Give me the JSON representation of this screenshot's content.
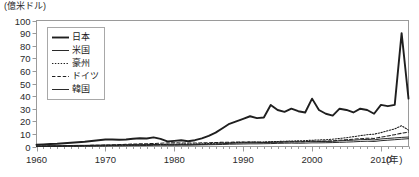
{
  "unit_label": "(億米ドル)",
  "source_note": "",
  "axes": {
    "y_ticks": [
      "0",
      "10",
      "20",
      "30",
      "40",
      "50",
      "60",
      "70",
      "80",
      "90",
      "100"
    ],
    "x_ticks": [
      "1960",
      "1970",
      "1980",
      "1990",
      "2000",
      "2010"
    ],
    "x_unit": "(年)"
  },
  "legend": {
    "items": [
      {
        "label": "日本",
        "style": "solid-thick",
        "color": "#1a1a1a"
      },
      {
        "label": "米国",
        "style": "solid",
        "color": "#3a3a3a"
      },
      {
        "label": "豪州",
        "style": "dotted",
        "color": "#3a3a3a"
      },
      {
        "label": "ドイツ",
        "style": "dashed",
        "color": "#3a3a3a"
      },
      {
        "label": "韓国",
        "style": "solid",
        "color": "#3a3a3a"
      }
    ]
  },
  "chart_data": {
    "type": "line",
    "title": "",
    "subtitle": "",
    "xlabel": "(年)",
    "ylabel": "(億米ドル)",
    "xlim": [
      1960,
      2014
    ],
    "ylim": [
      0,
      100
    ],
    "y_ticks": [
      0,
      10,
      20,
      30,
      40,
      50,
      60,
      70,
      80,
      90,
      100
    ],
    "x_ticks": [
      1960,
      1970,
      1980,
      1990,
      2000,
      2010
    ],
    "grid": false,
    "legend_position": "top-left-inside",
    "x": [
      1960,
      1961,
      1962,
      1963,
      1964,
      1965,
      1966,
      1967,
      1968,
      1969,
      1970,
      1971,
      1972,
      1973,
      1974,
      1975,
      1976,
      1977,
      1978,
      1979,
      1980,
      1981,
      1982,
      1983,
      1984,
      1985,
      1986,
      1987,
      1988,
      1989,
      1990,
      1991,
      1992,
      1993,
      1994,
      1995,
      1996,
      1997,
      1998,
      1999,
      2000,
      2001,
      2002,
      2003,
      2004,
      2005,
      2006,
      2007,
      2008,
      2009,
      2010,
      2011,
      2012,
      2013,
      2014
    ],
    "series": [
      {
        "name": "日本",
        "style": "solid-thick",
        "values": [
          1.5,
          1.7,
          2.0,
          2.2,
          2.6,
          3.0,
          3.4,
          3.8,
          4.4,
          5.0,
          5.5,
          5.6,
          5.4,
          5.6,
          6.2,
          6.6,
          6.4,
          7.2,
          6.0,
          4.0,
          4.5,
          5.0,
          4.2,
          5.0,
          6.5,
          8.5,
          11.0,
          14.5,
          18.0,
          20.0,
          22.0,
          24.0,
          22.5,
          23.0,
          33.0,
          29.0,
          27.5,
          30.0,
          28.0,
          27.0,
          38.0,
          29.0,
          26.0,
          24.5,
          30.0,
          29.0,
          27.0,
          30.0,
          29.0,
          26.0,
          33.0,
          32.0,
          33.0,
          90.0,
          38.0
        ]
      },
      {
        "name": "米国",
        "style": "solid",
        "values": [
          0.5,
          0.5,
          0.6,
          0.6,
          0.7,
          0.8,
          0.9,
          0.9,
          1.0,
          1.1,
          1.2,
          1.2,
          1.3,
          1.4,
          1.5,
          1.5,
          1.5,
          1.6,
          1.5,
          1.4,
          1.4,
          1.5,
          1.4,
          1.5,
          1.6,
          1.8,
          2.0,
          2.2,
          2.5,
          2.7,
          2.9,
          3.0,
          3.0,
          3.1,
          3.3,
          3.4,
          3.5,
          3.7,
          3.7,
          3.8,
          4.2,
          4.0,
          4.0,
          4.1,
          4.5,
          4.8,
          5.0,
          5.4,
          5.6,
          5.2,
          6.0,
          6.4,
          6.8,
          7.2,
          7.5
        ]
      },
      {
        "name": "豪州",
        "style": "dotted",
        "values": [
          0.2,
          0.2,
          0.3,
          0.3,
          0.3,
          0.4,
          0.4,
          0.5,
          0.5,
          0.6,
          0.7,
          0.8,
          0.9,
          1.0,
          1.1,
          1.2,
          1.3,
          1.5,
          1.6,
          1.7,
          1.8,
          1.9,
          1.9,
          2.0,
          2.2,
          2.4,
          2.6,
          2.8,
          3.0,
          3.2,
          3.4,
          3.5,
          3.5,
          3.6,
          3.8,
          4.0,
          4.2,
          4.4,
          4.5,
          4.7,
          5.0,
          5.2,
          5.4,
          5.8,
          6.4,
          7.0,
          7.8,
          8.6,
          9.4,
          9.8,
          11.0,
          12.5,
          14.0,
          16.5,
          13.0
        ]
      },
      {
        "name": "ドイツ",
        "style": "dashed",
        "values": [
          0.3,
          0.3,
          0.4,
          0.4,
          0.5,
          0.6,
          0.7,
          0.8,
          0.9,
          1.0,
          1.1,
          1.3,
          1.5,
          1.8,
          2.0,
          2.1,
          2.2,
          2.4,
          2.6,
          2.8,
          2.9,
          2.8,
          2.7,
          2.8,
          2.9,
          3.0,
          3.2,
          3.3,
          3.4,
          3.5,
          3.6,
          3.6,
          3.5,
          3.4,
          3.5,
          3.6,
          3.7,
          3.8,
          3.8,
          3.9,
          4.1,
          4.2,
          4.3,
          4.6,
          5.0,
          5.4,
          5.8,
          6.2,
          6.6,
          6.4,
          7.4,
          8.4,
          9.4,
          10.5,
          11.5
        ]
      },
      {
        "name": "韓国",
        "style": "solid",
        "values": [
          0.1,
          0.1,
          0.1,
          0.1,
          0.2,
          0.2,
          0.2,
          0.3,
          0.3,
          0.4,
          0.4,
          0.5,
          0.5,
          0.6,
          0.7,
          0.7,
          0.8,
          0.9,
          1.0,
          1.0,
          1.0,
          1.1,
          1.1,
          1.2,
          1.3,
          1.4,
          1.5,
          1.6,
          1.8,
          1.9,
          2.0,
          2.1,
          2.1,
          2.2,
          2.3,
          2.5,
          2.6,
          2.7,
          2.6,
          2.7,
          2.9,
          2.9,
          3.0,
          3.1,
          3.3,
          3.5,
          3.7,
          4.0,
          4.2,
          4.0,
          4.6,
          5.0,
          5.4,
          5.8,
          6.2
        ]
      }
    ]
  }
}
